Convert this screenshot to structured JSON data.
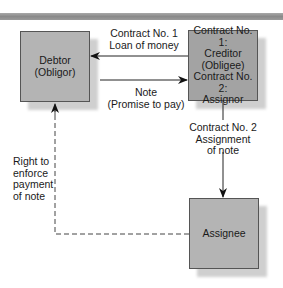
{
  "diagram": {
    "type": "flow",
    "nodes": [
      {
        "id": "debtor",
        "lines": [
          "Debtor",
          "(Obligor)"
        ]
      },
      {
        "id": "creditor",
        "lines": [
          "Contract No. 1:",
          "Creditor",
          "(Obligee)",
          "Contract No. 2:",
          "Assignor"
        ]
      },
      {
        "id": "assignee",
        "lines": [
          "Assignee"
        ]
      }
    ],
    "edges": [
      {
        "from": "creditor",
        "to": "debtor",
        "style": "solid",
        "label": [
          "Contract No. 1",
          "Loan of money"
        ]
      },
      {
        "from": "debtor",
        "to": "creditor",
        "style": "solid",
        "label": [
          "Note",
          "(Promise to pay)"
        ]
      },
      {
        "from": "creditor",
        "to": "assignee",
        "style": "solid",
        "label": [
          "Contract No. 2",
          "Assignment",
          "of note"
        ]
      },
      {
        "from": "assignee",
        "to": "debtor",
        "style": "dashed",
        "label": [
          "Right to",
          "enforce",
          "payment",
          "of note"
        ]
      }
    ]
  },
  "colors": {
    "debtor_fill": "#b4b4b4",
    "creditor_fill": "#a3a3a3",
    "assignee_fill": "#b4b4b4",
    "shadow": "#cfcfcf",
    "line": "#222222",
    "topbar": "#8a8a8a"
  }
}
